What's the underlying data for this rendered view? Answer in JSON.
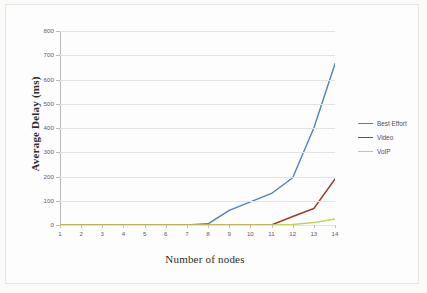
{
  "chart_data": {
    "type": "line",
    "title": "",
    "xlabel": "Number of nodes",
    "ylabel": "Average Delay (ms)",
    "x": [
      1,
      2,
      3,
      4,
      5,
      6,
      7,
      8,
      9,
      10,
      11,
      12,
      13,
      14
    ],
    "xticklabels": [
      "1",
      "2",
      "3",
      "4",
      "5",
      "6",
      "7",
      "8",
      "9",
      "10",
      "11",
      "12",
      "13",
      "14"
    ],
    "yticklabels": [
      "0",
      "100",
      "200",
      "300",
      "400",
      "500",
      "600",
      "700",
      "800"
    ],
    "yticks": [
      0,
      100,
      200,
      300,
      400,
      500,
      600,
      700,
      800
    ],
    "ylim": [
      0,
      800
    ],
    "xlim": [
      1,
      14
    ],
    "grid": "horizontal",
    "legend_position": "right",
    "series": [
      {
        "name": "Best Effort",
        "color": "#4f81bd",
        "values": [
          0,
          0,
          0,
          0,
          0,
          0,
          0,
          5,
          60,
          95,
          130,
          195,
          400,
          665
        ]
      },
      {
        "name": "Video",
        "color": "#9e3b28",
        "values": [
          0,
          0,
          0,
          0,
          0,
          0,
          0,
          0,
          0,
          0,
          0,
          35,
          68,
          190
        ]
      },
      {
        "name": "VoIP",
        "color": "#c3d350",
        "values": [
          0,
          0,
          0,
          0,
          0,
          0,
          0,
          0,
          0,
          0,
          0,
          2,
          10,
          25
        ]
      }
    ]
  },
  "legend": {
    "entries": [
      {
        "label": "Best Effort",
        "color": "#4f81bd"
      },
      {
        "label": "Video",
        "color": "#9e3b28"
      },
      {
        "label": "VoIP",
        "color": "#c3d350"
      }
    ]
  },
  "axes": {
    "y_title": "Average Delay (ms)",
    "x_title": "Number of nodes"
  }
}
